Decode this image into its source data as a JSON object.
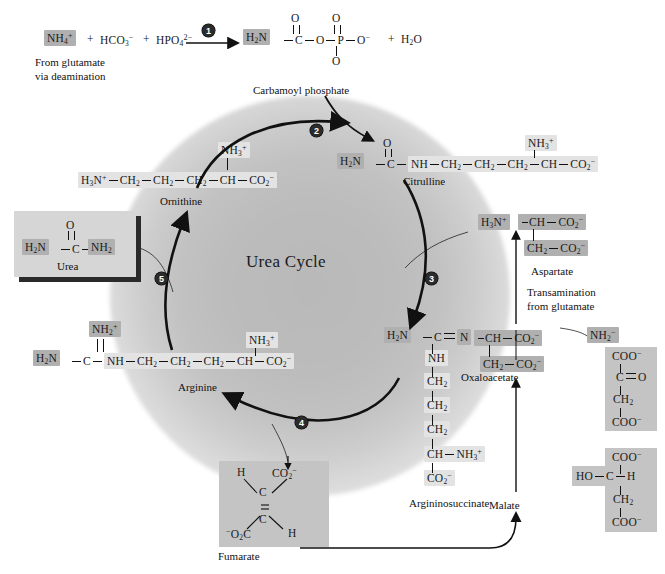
{
  "figure": {
    "center_title": "Urea Cycle"
  },
  "top_reaction": {
    "reactant1": "NH",
    "reactant1_sub": "4",
    "reactant1_sup": "+",
    "plus1": "+",
    "reactant2": "HCO",
    "reactant2_sub": "3",
    "reactant2_sup": "−",
    "plus2": "+",
    "reactant3": "HPO",
    "reactant3_sub": "4",
    "reactant3_sup": "2−",
    "step_number": "1",
    "source_note_line1": "From glutamate",
    "source_note_line2": "via deamination",
    "product_h2n": "H",
    "product_h2n_sub": "2",
    "product_h2n_tail": "N",
    "atom_c": "C",
    "atom_o_link": "O",
    "atom_p": "P",
    "o_top_left": "O",
    "o_top_right": "O",
    "o_bottom": "O",
    "o_minus": "O",
    "o_minus_sup": "−",
    "plus3": "+",
    "water": "H",
    "water_sub": "2",
    "water_tail": "O",
    "product_label": "Carbamoyl phosphate"
  },
  "citrulline": {
    "label": "Citrulline",
    "h2n": "H",
    "h2n_sub": "2",
    "h2n_tail": "N",
    "c": "C",
    "o": "O",
    "nh": "NH",
    "ch2_a": "CH",
    "ch2_a_sub": "2",
    "ch2_b": "CH",
    "ch2_b_sub": "2",
    "ch2_c": "CH",
    "ch2_c_sub": "2",
    "ch": "CH",
    "co2": "CO",
    "co2_sub": "2",
    "co2_sup": "−",
    "nh3": "NH",
    "nh3_sub": "3",
    "nh3_sup": "+"
  },
  "ornithine": {
    "label": "Ornithine",
    "h3n": "H",
    "h3n_sub": "3",
    "h3n_tail": "N",
    "h3n_sup": "+",
    "ch2_a": "CH",
    "ch2_a_sub": "2",
    "ch2_b": "CH",
    "ch2_b_sub": "2",
    "ch2_c": "CH",
    "ch2_c_sub": "2",
    "ch": "CH",
    "co2": "CO",
    "co2_sub": "2",
    "co2_sup": "−",
    "nh3": "NH",
    "nh3_sub": "3",
    "nh3_sup": "+"
  },
  "urea": {
    "label": "Urea",
    "h2n": "H",
    "h2n_sub": "2",
    "h2n_tail": "N",
    "c": "C",
    "o": "O",
    "nh2": "NH",
    "nh2_sub": "2"
  },
  "arginine": {
    "label": "Arginine",
    "h2n": "H",
    "h2n_sub": "2",
    "h2n_tail": "N",
    "c": "C",
    "nh2_plus": "NH",
    "nh2_plus_sub": "2",
    "nh2_plus_sup": "+",
    "nh": "NH",
    "ch2_a": "CH",
    "ch2_a_sub": "2",
    "ch2_b": "CH",
    "ch2_b_sub": "2",
    "ch2_c": "CH",
    "ch2_c_sub": "2",
    "ch": "CH",
    "co2": "CO",
    "co2_sub": "2",
    "co2_sup": "−",
    "nh3": "NH",
    "nh3_sub": "3",
    "nh3_sup": "+"
  },
  "argininosuccinate": {
    "label": "Argininosuccinate",
    "h2n": "H",
    "h2n_sub": "2",
    "h2n_tail": "N",
    "c": "C",
    "n": "N",
    "ch_top": "CH",
    "co2_top": "CO",
    "co2_top_sub": "2",
    "co2_top_sup": "−",
    "ch2_side": "CH",
    "ch2_side_sub": "2",
    "co2_side": "CO",
    "co2_side_sub": "2",
    "co2_side_sup": "−",
    "nh": "NH",
    "ch2_1": "CH",
    "ch2_1_sub": "2",
    "ch2_2": "CH",
    "ch2_2_sub": "2",
    "ch2_3": "CH",
    "ch2_3_sub": "2",
    "ch_bottom": "CH",
    "nh3": "NH",
    "nh3_sub": "3",
    "nh3_sup": "+",
    "co2_bottom": "CO",
    "co2_bottom_sub": "2",
    "co2_bottom_sup": "−"
  },
  "aspartate": {
    "label": "Aspartate",
    "h3n": "H",
    "h3n_sub": "3",
    "h3n_tail": "N",
    "h3n_sup": "+",
    "ch": "CH",
    "co2_top": "CO",
    "co2_top_sub": "2",
    "co2_top_sup": "−",
    "ch2": "CH",
    "ch2_sub": "2",
    "co2_bottom": "CO",
    "co2_bottom_sub": "2",
    "co2_bottom_sup": "−"
  },
  "transamination": {
    "line1": "Transamination",
    "line2": "from glutamate",
    "nh2": "NH",
    "nh2_sub": "2",
    "nh2_sup": "−"
  },
  "oxaloacetate": {
    "label": "Oxaloacetate",
    "coo_top": "COO",
    "coo_top_sup": "−",
    "c": "C",
    "o": "O",
    "ch2": "CH",
    "ch2_sub": "2",
    "coo_bottom": "COO",
    "coo_bottom_sup": "−"
  },
  "malate": {
    "label": "Malate",
    "coo_top": "COO",
    "coo_top_sup": "−",
    "ho": "HO",
    "c": "C",
    "h": "H",
    "ch2": "CH",
    "ch2_sub": "2",
    "coo_bottom": "COO",
    "coo_bottom_sup": "−"
  },
  "fumarate": {
    "label": "Fumarate",
    "h_top": "H",
    "co2_top": "CO",
    "co2_top_sub": "2",
    "co2_top_sup": "−",
    "c_top": "C",
    "c_bottom": "C",
    "o2c": "O",
    "o2c_sub": "2",
    "o2c_sup": "−",
    "o2c_tail": "C",
    "h_bottom": "H"
  },
  "steps": {
    "s1": "1",
    "s2": "2",
    "s3": "3",
    "s4": "4",
    "s5": "5"
  },
  "colors": {
    "plate_light": "#e3e3e3",
    "plate_mid": "#b0b0b0",
    "plate_box": "#c4c4c4",
    "ink": "#1a1a1a",
    "cycle_glow": "#bcbcbc"
  }
}
